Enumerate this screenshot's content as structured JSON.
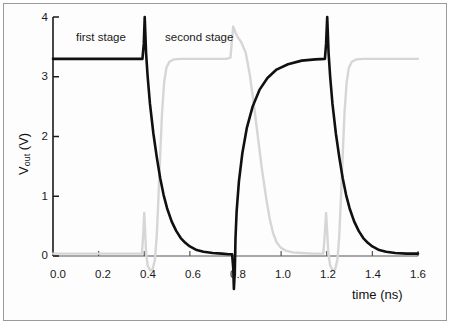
{
  "figure": {
    "background": "#ffffff",
    "frame_color": "#9a9a9a"
  },
  "chart_data": {
    "type": "line",
    "title": "",
    "xlabel_text": "time (ns)",
    "ylabel_main": "V",
    "ylabel_sub": "out",
    "ylabel_unit": " (V)",
    "xlim": [
      0.0,
      1.6
    ],
    "ylim": [
      0.0,
      4.0
    ],
    "grid": false,
    "legend_position": "none",
    "xticks": [
      0.0,
      0.2,
      0.4,
      0.6,
      0.8,
      1.0,
      1.2,
      1.4,
      1.6
    ],
    "xtick_labels": [
      "0.0",
      "0.2",
      "0.4",
      "0.6",
      "0.8",
      "1.0",
      "1.2",
      "1.4",
      "1.6"
    ],
    "yticks": [
      0,
      1,
      2,
      3,
      4
    ],
    "ytick_labels": [
      "0",
      "1",
      "2",
      "3",
      "4"
    ],
    "vdd": 3.3,
    "annotations": [
      {
        "text": "first stage",
        "x": 0.27,
        "y": 3.7
      },
      {
        "text": "second stage",
        "x": 0.72,
        "y": 3.7
      }
    ],
    "series": [
      {
        "name": "first stage",
        "color": "#101010",
        "width": 2.6,
        "points": [
          [
            0.0,
            3.3
          ],
          [
            0.1,
            3.3
          ],
          [
            0.2,
            3.3
          ],
          [
            0.3,
            3.3
          ],
          [
            0.37,
            3.3
          ],
          [
            0.392,
            3.3
          ],
          [
            0.398,
            3.55
          ],
          [
            0.402,
            4.0
          ],
          [
            0.408,
            3.4
          ],
          [
            0.415,
            3.0
          ],
          [
            0.425,
            2.55
          ],
          [
            0.44,
            2.05
          ],
          [
            0.455,
            1.65
          ],
          [
            0.47,
            1.3
          ],
          [
            0.485,
            1.02
          ],
          [
            0.5,
            0.8
          ],
          [
            0.52,
            0.58
          ],
          [
            0.54,
            0.42
          ],
          [
            0.56,
            0.3
          ],
          [
            0.58,
            0.22
          ],
          [
            0.6,
            0.16
          ],
          [
            0.63,
            0.1
          ],
          [
            0.66,
            0.07
          ],
          [
            0.7,
            0.05
          ],
          [
            0.74,
            0.04
          ],
          [
            0.77,
            0.03
          ],
          [
            0.785,
            0.03
          ],
          [
            0.79,
            -0.2
          ],
          [
            0.793,
            -0.55
          ],
          [
            0.797,
            -0.25
          ],
          [
            0.8,
            0.3
          ],
          [
            0.805,
            0.75
          ],
          [
            0.815,
            1.25
          ],
          [
            0.83,
            1.72
          ],
          [
            0.85,
            2.15
          ],
          [
            0.875,
            2.5
          ],
          [
            0.905,
            2.78
          ],
          [
            0.94,
            2.98
          ],
          [
            0.98,
            3.12
          ],
          [
            1.03,
            3.21
          ],
          [
            1.09,
            3.27
          ],
          [
            1.15,
            3.29
          ],
          [
            1.192,
            3.3
          ],
          [
            1.197,
            3.55
          ],
          [
            1.202,
            4.0
          ],
          [
            1.208,
            3.4
          ],
          [
            1.215,
            3.0
          ],
          [
            1.225,
            2.55
          ],
          [
            1.24,
            2.05
          ],
          [
            1.255,
            1.65
          ],
          [
            1.27,
            1.3
          ],
          [
            1.285,
            1.02
          ],
          [
            1.3,
            0.8
          ],
          [
            1.32,
            0.58
          ],
          [
            1.34,
            0.42
          ],
          [
            1.36,
            0.3
          ],
          [
            1.38,
            0.22
          ],
          [
            1.4,
            0.16
          ],
          [
            1.43,
            0.1
          ],
          [
            1.46,
            0.07
          ],
          [
            1.5,
            0.05
          ],
          [
            1.55,
            0.04
          ],
          [
            1.6,
            0.04
          ]
        ]
      },
      {
        "name": "second stage",
        "color": "#d6d6d6",
        "width": 2.4,
        "points": [
          [
            0.0,
            0.04
          ],
          [
            0.1,
            0.04
          ],
          [
            0.2,
            0.04
          ],
          [
            0.3,
            0.04
          ],
          [
            0.39,
            0.04
          ],
          [
            0.396,
            0.4
          ],
          [
            0.4,
            0.72
          ],
          [
            0.404,
            0.4
          ],
          [
            0.408,
            0.05
          ],
          [
            0.415,
            -0.16
          ],
          [
            0.425,
            -0.24
          ],
          [
            0.437,
            -0.22
          ],
          [
            0.447,
            -0.06
          ],
          [
            0.455,
            0.35
          ],
          [
            0.462,
            0.95
          ],
          [
            0.47,
            1.7
          ],
          [
            0.478,
            2.4
          ],
          [
            0.487,
            2.9
          ],
          [
            0.497,
            3.15
          ],
          [
            0.51,
            3.25
          ],
          [
            0.53,
            3.29
          ],
          [
            0.56,
            3.3
          ],
          [
            0.62,
            3.3
          ],
          [
            0.7,
            3.3
          ],
          [
            0.76,
            3.3
          ],
          [
            0.778,
            3.32
          ],
          [
            0.784,
            3.6
          ],
          [
            0.79,
            3.84
          ],
          [
            0.796,
            3.78
          ],
          [
            0.802,
            3.72
          ],
          [
            0.81,
            3.66
          ],
          [
            0.825,
            3.58
          ],
          [
            0.845,
            3.4
          ],
          [
            0.862,
            3.05
          ],
          [
            0.88,
            2.55
          ],
          [
            0.898,
            2.0
          ],
          [
            0.916,
            1.45
          ],
          [
            0.934,
            0.98
          ],
          [
            0.95,
            0.62
          ],
          [
            0.965,
            0.38
          ],
          [
            0.98,
            0.23
          ],
          [
            0.998,
            0.14
          ],
          [
            1.02,
            0.09
          ],
          [
            1.05,
            0.06
          ],
          [
            1.09,
            0.05
          ],
          [
            1.14,
            0.04
          ],
          [
            1.185,
            0.04
          ],
          [
            1.192,
            0.4
          ],
          [
            1.197,
            0.72
          ],
          [
            1.202,
            0.4
          ],
          [
            1.207,
            0.05
          ],
          [
            1.215,
            -0.16
          ],
          [
            1.225,
            -0.24
          ],
          [
            1.237,
            -0.22
          ],
          [
            1.247,
            -0.06
          ],
          [
            1.255,
            0.35
          ],
          [
            1.262,
            0.95
          ],
          [
            1.27,
            1.7
          ],
          [
            1.278,
            2.4
          ],
          [
            1.287,
            2.9
          ],
          [
            1.297,
            3.15
          ],
          [
            1.31,
            3.25
          ],
          [
            1.33,
            3.29
          ],
          [
            1.36,
            3.3
          ],
          [
            1.42,
            3.3
          ],
          [
            1.5,
            3.3
          ],
          [
            1.6,
            3.3
          ]
        ]
      }
    ]
  }
}
